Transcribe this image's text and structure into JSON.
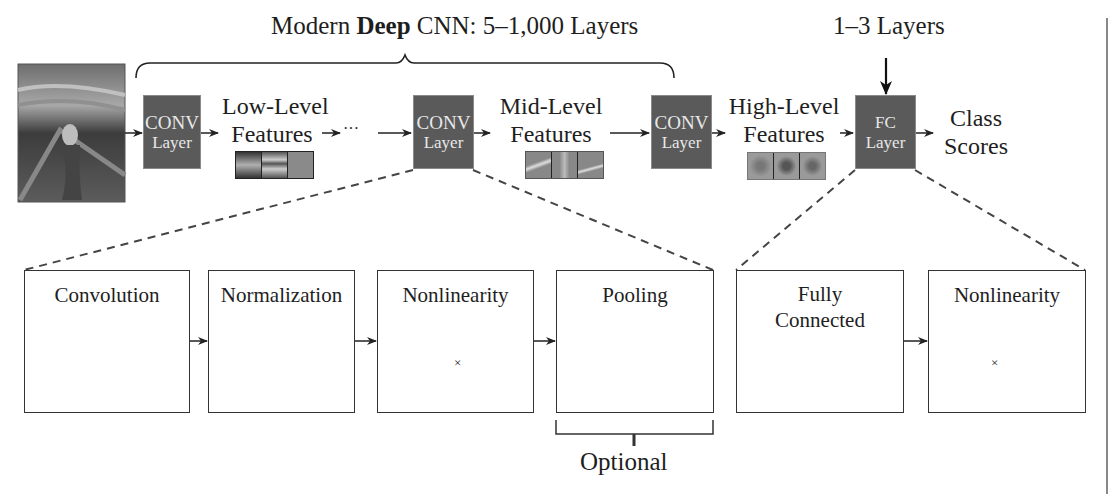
{
  "header": {
    "title_prefix": "Modern ",
    "title_bold": "Deep",
    "title_suffix": " CNN: 5–1,000 Layers",
    "fc_note": "1–3 Layers"
  },
  "pipeline": {
    "input_image": "scream-painting-image",
    "ellipsis": "···",
    "conv_layers": [
      {
        "line1": "CONV",
        "line2": "Layer"
      },
      {
        "line1": "CONV",
        "line2": "Layer"
      },
      {
        "line1": "CONV",
        "line2": "Layer"
      }
    ],
    "fc_layer": {
      "line1": "FC",
      "line2": "Layer"
    },
    "features": [
      {
        "line1": "Low-Level",
        "line2": "Features"
      },
      {
        "line1": "Mid-Level",
        "line2": "Features"
      },
      {
        "line1": "High-Level",
        "line2": "Features"
      }
    ],
    "output": {
      "line1": "Class",
      "line2": "Scores"
    }
  },
  "conv_detail": {
    "stages": [
      {
        "title": "Convolution"
      },
      {
        "title": "Normalization"
      },
      {
        "title": "Nonlinearity",
        "times": "×"
      },
      {
        "title": "Pooling"
      }
    ],
    "optional_label": "Optional"
  },
  "fc_detail": {
    "stages": [
      {
        "title_line1": "Fully",
        "title_line2": "Connected"
      },
      {
        "title": "Nonlinearity",
        "times": "×"
      }
    ]
  },
  "colors": {
    "layer_fill": "#5a5a5a",
    "layer_text": "#e8e8e8",
    "feature_map_light": "#9a9a9a",
    "feature_map_mid": "#7a7a7a",
    "text": "#1e1e1e"
  }
}
